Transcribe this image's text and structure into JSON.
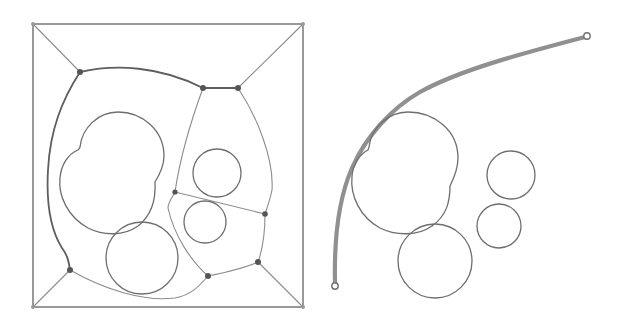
{
  "figure": {
    "panels": [
      {
        "id": "left",
        "description": "Voronoi-style roadmap of circular obstacles inside a square boundary",
        "boundary": {
          "x": 33,
          "y": 24,
          "width": 270,
          "height": 283
        },
        "vertices": [
          {
            "id": "A",
            "x": 80,
            "y": 72
          },
          {
            "id": "B",
            "x": 203,
            "y": 88
          },
          {
            "id": "C",
            "x": 238,
            "y": 88
          },
          {
            "id": "D",
            "x": 175,
            "y": 192
          },
          {
            "id": "E",
            "x": 265,
            "y": 214
          },
          {
            "id": "F",
            "x": 70,
            "y": 270
          },
          {
            "id": "G",
            "x": 208,
            "y": 276
          },
          {
            "id": "H",
            "x": 258,
            "y": 262
          }
        ],
        "obstacles": [
          {
            "type": "blob",
            "label": "merged-circles"
          },
          {
            "type": "circle",
            "cx": 142,
            "cy": 258,
            "r": 36
          },
          {
            "type": "circle",
            "cx": 217,
            "cy": 173,
            "r": 24
          },
          {
            "type": "circle",
            "cx": 205,
            "cy": 222,
            "r": 21
          }
        ]
      },
      {
        "id": "right",
        "description": "Smooth path around the same obstacles",
        "path": {
          "start": {
            "x": 335,
            "y": 286
          },
          "end": {
            "x": 587,
            "y": 36
          }
        },
        "obstacles": [
          {
            "type": "blob",
            "label": "merged-circles"
          },
          {
            "type": "circle",
            "cx": 435,
            "cy": 261,
            "r": 37
          },
          {
            "type": "circle",
            "cx": 511,
            "cy": 175,
            "r": 24
          },
          {
            "type": "circle",
            "cx": 499,
            "cy": 226,
            "r": 22
          }
        ]
      }
    ],
    "colors": {
      "background": "#ffffff",
      "line": "#7a7a7a",
      "vertex": "#555555",
      "path": "#909090"
    }
  }
}
